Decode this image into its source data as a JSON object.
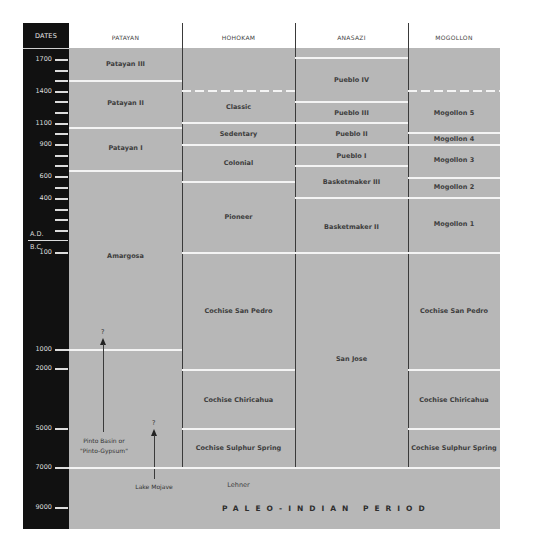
{
  "header": {
    "dates": "DATES",
    "columns": [
      "PATAYAN",
      "HOHOKAM",
      "ANASAZI",
      "MOGOLLON"
    ]
  },
  "timeline": {
    "ticks": [
      {
        "label": "1700",
        "y": 60
      },
      {
        "label": "",
        "y": 71
      },
      {
        "label": "",
        "y": 81
      },
      {
        "label": "1400",
        "y": 92
      },
      {
        "label": "",
        "y": 102
      },
      {
        "label": "",
        "y": 113
      },
      {
        "label": "1100",
        "y": 124
      },
      {
        "label": "",
        "y": 134
      },
      {
        "label": "900",
        "y": 145
      },
      {
        "label": "",
        "y": 156
      },
      {
        "label": "",
        "y": 166
      },
      {
        "label": "600",
        "y": 177
      },
      {
        "label": "",
        "y": 188
      },
      {
        "label": "400",
        "y": 199
      },
      {
        "label": "",
        "y": 210
      },
      {
        "label": "",
        "y": 220
      },
      {
        "label": "",
        "y": 231
      },
      {
        "label": "100",
        "y": 253
      },
      {
        "label": "1000",
        "y": 350
      },
      {
        "label": "2000",
        "y": 369
      },
      {
        "label": "5000",
        "y": 429
      },
      {
        "label": "7000",
        "y": 468
      },
      {
        "label": "9000",
        "y": 508
      }
    ],
    "ad_label": "A.D.",
    "bc_label": "B.C."
  },
  "patayan": {
    "phases": [
      "Patayan III",
      "Patayan II",
      "Patayan I",
      "Amargosa"
    ],
    "note_pinto_line1": "Pinto Basin or",
    "note_pinto_line2": "\"Pinto-Gypsum\"",
    "note_mojave": "Lake Mojave",
    "question_mark": "?"
  },
  "hohokam": {
    "phases": [
      "Classic",
      "Sedentary",
      "Colonial",
      "Pioneer",
      "Cochise San Pedro",
      "Cochise Chiricahua",
      "Cochise Sulphur Spring",
      "Lehner"
    ]
  },
  "anasazi": {
    "phases": [
      "Pueblo IV",
      "Pueblo III",
      "Pueblo II",
      "Pueblo I",
      "Basketmaker III",
      "Basketmaker II",
      "San Jose"
    ]
  },
  "mogollon": {
    "phases": [
      "Mogollon 5",
      "Mogollon 4",
      "Mogollon 3",
      "Mogollon 2",
      "Mogollon 1",
      "Cochise San Pedro",
      "Cochise Chiricahua",
      "Cochise Sulphur Spring"
    ]
  },
  "paleo_indian": "PALEO-INDIAN PERIOD",
  "colors": {
    "date_bar": "#111111",
    "band": "#b7b7b7",
    "divider": "#f4f4f4",
    "column_rule": "#3a3a3a"
  }
}
